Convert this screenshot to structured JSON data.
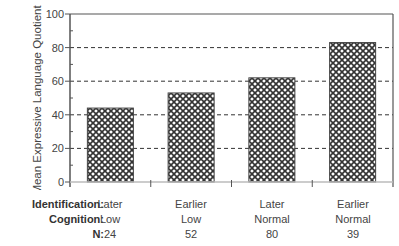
{
  "chart_data": {
    "type": "bar",
    "title": "",
    "xlabel": "",
    "ylabel": "Mean Expressive Language Quotient",
    "ylim": [
      0,
      100
    ],
    "yticks": [
      0,
      20,
      40,
      60,
      80,
      100
    ],
    "grid": "dashed horizontal at 20, 40, 60, 80",
    "categories": [
      {
        "identification": "Later",
        "cognition": "Low",
        "n": "24"
      },
      {
        "identification": "Earlier",
        "cognition": "Low",
        "n": "52"
      },
      {
        "identification": "Later",
        "cognition": "Normal",
        "n": "80"
      },
      {
        "identification": "Earlier",
        "cognition": "Normal",
        "n": "39"
      }
    ],
    "values": [
      44,
      53,
      62,
      83
    ],
    "bar_pattern": "cross-hatch",
    "row_labels": {
      "identification": "Identification:",
      "cognition": "Cognition:",
      "n": "N:"
    }
  },
  "colors": {
    "axis": "#555555",
    "grid": "#333333",
    "bar_edge": "#444444",
    "hatch": "#333333"
  }
}
